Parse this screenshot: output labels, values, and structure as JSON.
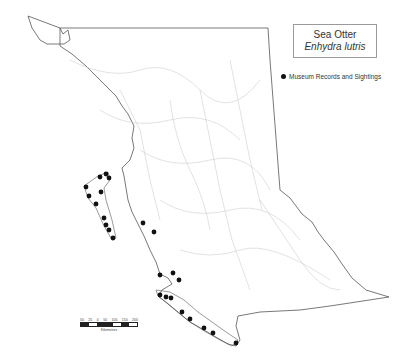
{
  "title": {
    "common_name": "Sea Otter",
    "latin_name": "Enhydra lutris"
  },
  "legend": {
    "items": [
      {
        "symbol": "filled-circle",
        "label": "Museum Records and Sightings",
        "color": "#111111"
      }
    ]
  },
  "scale_bar": {
    "ticks": [
      "50",
      "25",
      "0",
      "50",
      "100",
      "150",
      "200"
    ],
    "unit": "Kilometres"
  },
  "colors": {
    "outline": "#555555",
    "rivers": "#bdbdbd",
    "points": "#111111",
    "background": "#ffffff"
  },
  "points": [
    [
      86,
      187
    ],
    [
      89,
      196
    ],
    [
      96,
      204
    ],
    [
      104,
      218
    ],
    [
      106,
      225
    ],
    [
      109,
      230
    ],
    [
      113,
      238
    ],
    [
      100,
      177
    ],
    [
      101,
      192
    ],
    [
      106,
      174
    ],
    [
      109,
      178
    ],
    [
      143,
      223
    ],
    [
      154,
      232
    ],
    [
      160,
      275
    ],
    [
      173,
      273
    ],
    [
      179,
      280
    ],
    [
      160,
      295
    ],
    [
      166,
      297
    ],
    [
      171,
      298
    ],
    [
      182,
      312
    ],
    [
      190,
      319
    ],
    [
      204,
      328
    ],
    [
      213,
      333
    ],
    [
      236,
      343
    ]
  ]
}
